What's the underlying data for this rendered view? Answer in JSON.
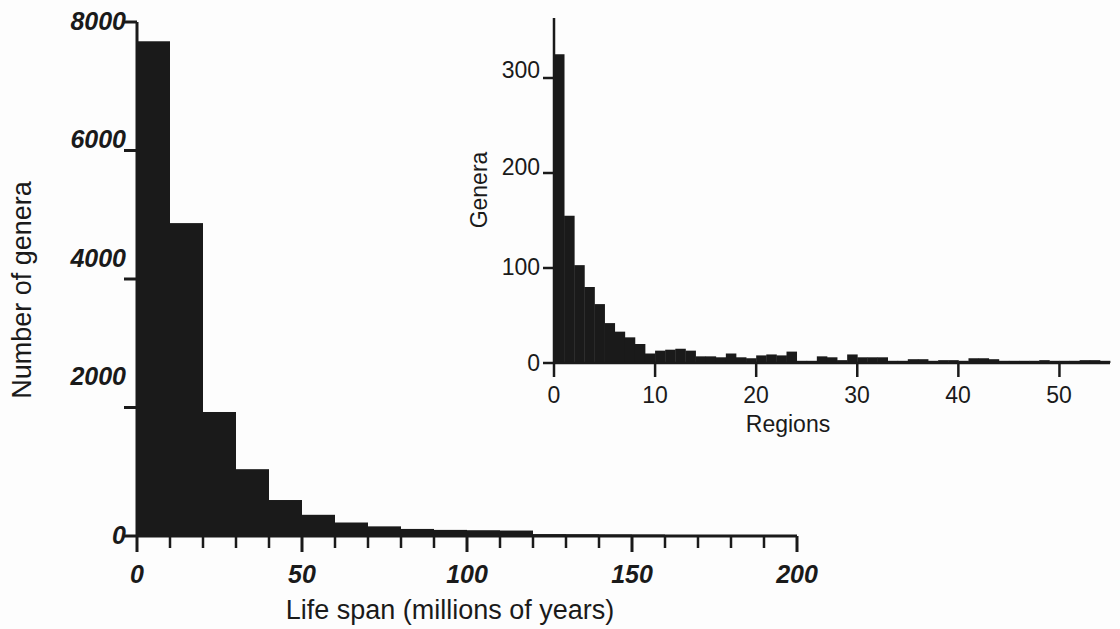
{
  "chart_data": [
    {
      "id": "main",
      "type": "bar",
      "title": "",
      "xlabel": "Life span (millions of years)",
      "ylabel": "Number of genera",
      "xlim": [
        0,
        200
      ],
      "ylim": [
        0,
        8000
      ],
      "xticks": [
        0,
        50,
        100,
        150,
        200
      ],
      "xticklabels": [
        "0",
        "50",
        "100",
        "150",
        "200"
      ],
      "minor_tick_step": 10,
      "yticks": [
        0,
        2000,
        4000,
        6000,
        8000
      ],
      "yticklabels": [
        "0",
        "2000",
        "4000",
        "6000",
        "8000"
      ],
      "grid": false,
      "legend": "none",
      "bin_width": 10,
      "bin_starts": [
        0,
        10,
        20,
        30,
        40,
        50,
        60,
        70,
        80,
        90,
        100,
        110,
        120,
        130,
        140,
        150,
        160,
        170,
        180,
        190
      ],
      "categories": [
        "0-10",
        "10-20",
        "20-30",
        "30-40",
        "40-50",
        "50-60",
        "60-70",
        "70-80",
        "80-90",
        "90-100",
        "100-110",
        "110-120",
        "120-130",
        "130-140",
        "140-150",
        "150-160",
        "160-170",
        "170-180",
        "180-190",
        "190-200"
      ],
      "values": [
        7700,
        4870,
        1930,
        1040,
        560,
        330,
        210,
        150,
        110,
        95,
        90,
        85,
        30,
        28,
        25,
        22,
        0,
        0,
        0,
        0
      ]
    },
    {
      "id": "inset",
      "type": "bar",
      "title": "",
      "xlabel": "Regions",
      "ylabel": "Genera",
      "xlim": [
        0,
        55
      ],
      "ylim": [
        0,
        340
      ],
      "xticks": [
        0,
        10,
        20,
        30,
        40,
        50
      ],
      "xticklabels": [
        "0",
        "10",
        "20",
        "30",
        "40",
        "50"
      ],
      "minor_tick_step": 10,
      "yticks": [
        0,
        100,
        200,
        300
      ],
      "yticklabels": [
        "0",
        "100",
        "200",
        "300"
      ],
      "grid": false,
      "legend": "none",
      "bin_width": 1,
      "categories": [
        "1",
        "2",
        "3",
        "4",
        "5",
        "6",
        "7",
        "8",
        "9",
        "10",
        "11",
        "12",
        "13",
        "14",
        "15",
        "16",
        "17",
        "18",
        "19",
        "20",
        "21",
        "22",
        "23",
        "24",
        "25",
        "26",
        "27",
        "28",
        "29",
        "30",
        "31",
        "32",
        "33",
        "34",
        "35",
        "36",
        "37",
        "38",
        "39",
        "40",
        "41",
        "42",
        "43",
        "44",
        "45",
        "46",
        "47",
        "48",
        "49",
        "50",
        "51",
        "52",
        "53",
        "54",
        "55"
      ],
      "values": [
        325,
        155,
        103,
        80,
        62,
        42,
        33,
        27,
        20,
        10,
        13,
        14,
        15,
        13,
        7,
        7,
        6,
        10,
        6,
        5,
        8,
        9,
        8,
        12,
        2,
        2,
        7,
        6,
        3,
        9,
        6,
        6,
        6,
        2,
        1,
        4,
        4,
        1,
        3,
        3,
        2,
        5,
        5,
        4,
        2,
        2,
        2,
        1,
        3,
        1,
        1,
        1,
        3,
        3,
        1
      ]
    }
  ],
  "main_axis": {
    "ylabel": "Number of genera",
    "xlabel": "Life span (millions of years)",
    "ytick_0": "0",
    "ytick_2000": "2000",
    "ytick_4000": "4000",
    "ytick_6000": "6000",
    "ytick_8000": "8000",
    "xtick_0": "0",
    "xtick_50": "50",
    "xtick_100": "100",
    "xtick_150": "150",
    "xtick_200": "200"
  },
  "inset_axis": {
    "ylabel": "Genera",
    "xlabel": "Regions",
    "ytick_0": "0",
    "ytick_100": "100",
    "ytick_200": "200",
    "ytick_300": "300",
    "xtick_0": "0",
    "xtick_10": "10",
    "xtick_20": "20",
    "xtick_30": "30",
    "xtick_40": "40",
    "xtick_50": "50"
  },
  "colors": {
    "ink": "#1a1a1a",
    "background": "#fdfdfd"
  }
}
